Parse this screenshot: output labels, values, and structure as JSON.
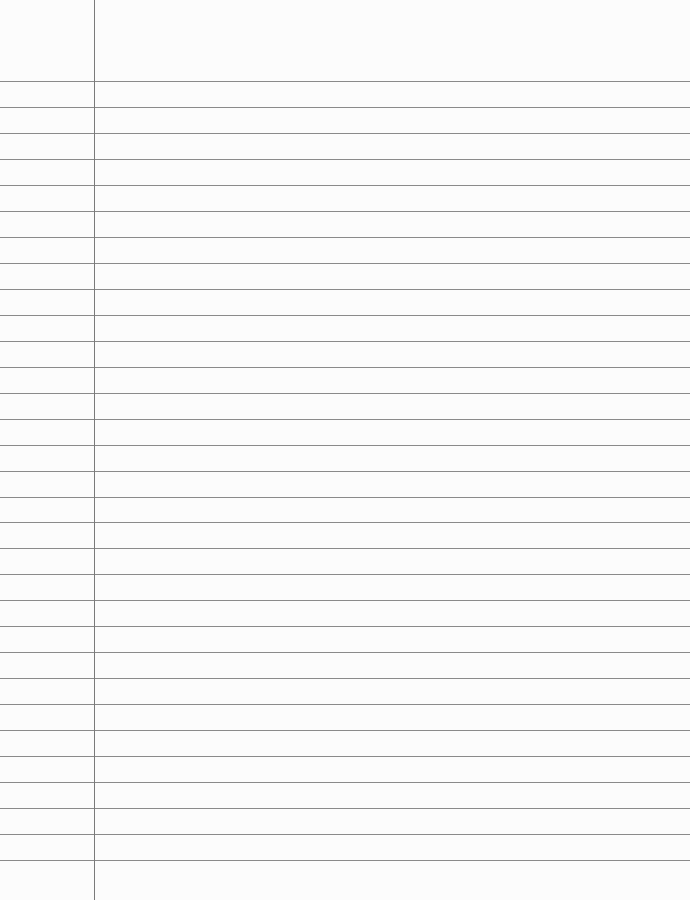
{
  "paper": {
    "type": "lined-paper",
    "rule_count": 31,
    "first_rule_y": 81,
    "rule_spacing": 25.97,
    "rule_color": "#8a8a8a",
    "margin_x": 94,
    "margin_color": "#7a7a7a",
    "background": "#fcfcfc"
  }
}
